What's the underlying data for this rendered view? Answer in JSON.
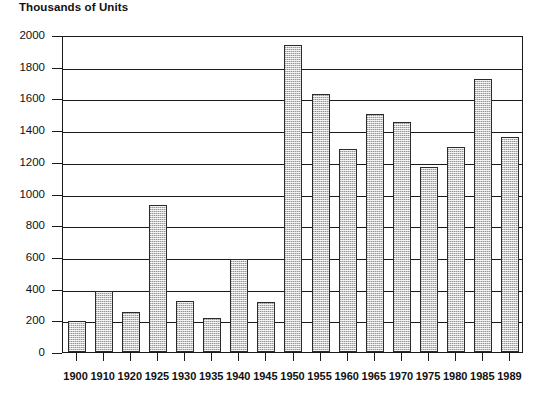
{
  "chart_data": {
    "type": "bar",
    "title": "Thousands of Units",
    "xlabel": "",
    "ylabel": "",
    "ylim": [
      0,
      2000
    ],
    "ytick_step": 200,
    "yticks": [
      0,
      200,
      400,
      600,
      800,
      1000,
      1200,
      1400,
      1600,
      1800,
      2000
    ],
    "grid": true,
    "legend": "none",
    "categories": [
      "1900",
      "1910",
      "1920",
      "1925",
      "1930",
      "1935",
      "1940",
      "1945",
      "1950",
      "1955",
      "1960",
      "1965",
      "1970",
      "1975",
      "1980",
      "1985",
      "1989"
    ],
    "values": [
      195,
      385,
      250,
      930,
      325,
      215,
      585,
      315,
      1940,
      1630,
      1280,
      1500,
      1450,
      1165,
      1295,
      1720,
      1355
    ],
    "series": [
      {
        "name": "Units",
        "values": [
          195,
          385,
          250,
          930,
          325,
          215,
          585,
          315,
          1940,
          1630,
          1280,
          1500,
          1450,
          1165,
          1295,
          1720,
          1355
        ]
      }
    ],
    "bar_fill": "#c9c9c9",
    "bar_border": "#2b2b2b",
    "axis_color": "#1a1a1a",
    "background": "#ffffff"
  }
}
